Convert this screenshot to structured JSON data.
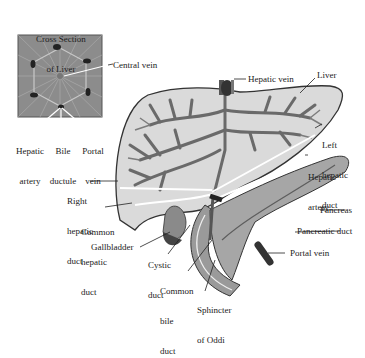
{
  "diagram": {
    "inset": {
      "title_line1": "Cross Section",
      "title_line2": "of Liver",
      "labels": {
        "central_vein": "Central vein",
        "hepatic_artery_1": "Hepatic",
        "hepatic_artery_2": "artery",
        "bile_ductule_1": "Bile",
        "bile_ductule_2": "ductule",
        "portal_vein_1": "Portal",
        "portal_vein_2": "vein"
      }
    },
    "labels": {
      "hepatic_vein": "Hepatic vein",
      "liver": "Liver",
      "left_hepatic_duct_1": "Left",
      "left_hepatic_duct_2": "hepatic",
      "left_hepatic_duct_3": "duct",
      "hepatic_artery_1": "Hepatic",
      "hepatic_artery_2": "artery",
      "right_hepatic_duct_1": "Right",
      "right_hepatic_duct_2": "hepatic",
      "right_hepatic_duct_3": "duct",
      "common_hepatic_duct_1": "Common",
      "common_hepatic_duct_2": "hepatic",
      "common_hepatic_duct_3": "duct",
      "gallbladder": "Gallbladder",
      "cystic_duct_1": "Cystic",
      "cystic_duct_2": "duct",
      "common_bile_duct_1": "Common",
      "common_bile_duct_2": "bile",
      "common_bile_duct_3": "duct",
      "sphincter_1": "Sphincter",
      "sphincter_2": "of Oddi",
      "pancreas": "Pancreas",
      "pancreatic_duct": "Pancreatic duct",
      "portal_vein": "Portal vein"
    },
    "colors": {
      "liver_fill": "#d9d9d9",
      "vessel": "#6e6e6e",
      "dark_vessel": "#3a3a3a",
      "pancreas_fill": "#a8a8a8",
      "inset_fill": "#8a8a8a",
      "outline": "#333333"
    }
  }
}
